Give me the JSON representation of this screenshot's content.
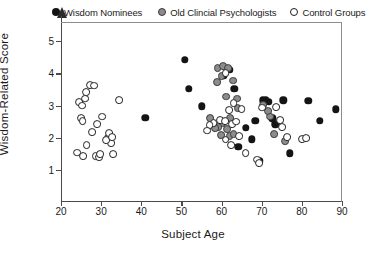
{
  "chart_data": {
    "type": "scatter",
    "title": "",
    "xlabel": "Subject Age",
    "ylabel": "Wisdom-Related Score",
    "xlim": [
      20,
      90
    ],
    "ylim": [
      0,
      5.6
    ],
    "xticks": [
      20,
      30,
      40,
      50,
      60,
      70,
      80,
      90
    ],
    "yticks": [
      1,
      2,
      3,
      4,
      5
    ],
    "grid": false,
    "legend_position": "top",
    "series": [
      {
        "name": "Wisdom Nominees",
        "marker": "filled-circle",
        "color": "#141414",
        "points": [
          [
            41.0,
            2.62
          ],
          [
            50.8,
            4.43
          ],
          [
            51.8,
            3.52
          ],
          [
            55.0,
            2.98
          ],
          [
            60.6,
            3.92
          ],
          [
            62.0,
            4.12
          ],
          [
            63.2,
            3.52
          ],
          [
            66.0,
            2.3
          ],
          [
            67.5,
            1.95
          ],
          [
            68.4,
            2.52
          ],
          [
            70.2,
            3.16
          ],
          [
            71.0,
            3.18
          ],
          [
            71.8,
            3.12
          ],
          [
            72.6,
            2.6
          ],
          [
            73.4,
            2.42
          ],
          [
            69.6,
            1.28
          ],
          [
            75.4,
            3.16
          ],
          [
            77.0,
            1.52
          ],
          [
            81.6,
            3.14
          ],
          [
            84.4,
            2.52
          ],
          [
            88.4,
            2.88
          ],
          [
            64.2,
            1.72
          ]
        ]
      },
      {
        "name": "Old Clincial Psychologists",
        "marker": "gray-circle",
        "color": "#8c8c8c",
        "points": [
          [
            59.0,
            4.16
          ],
          [
            60.4,
            4.22
          ],
          [
            61.6,
            4.16
          ],
          [
            58.8,
            3.74
          ],
          [
            62.8,
            3.78
          ],
          [
            60.0,
            3.92
          ],
          [
            61.2,
            3.28
          ],
          [
            63.8,
            3.22
          ],
          [
            64.0,
            2.92
          ],
          [
            62.2,
            2.6
          ],
          [
            60.2,
            2.44
          ],
          [
            61.4,
            2.28
          ],
          [
            59.2,
            2.32
          ],
          [
            58.4,
            2.3
          ],
          [
            59.8,
            2.08
          ],
          [
            62.0,
            2.04
          ],
          [
            57.2,
            2.6
          ],
          [
            63.0,
            2.12
          ],
          [
            70.4,
            3.02
          ],
          [
            71.6,
            2.82
          ],
          [
            72.0,
            2.66
          ],
          [
            73.0,
            2.12
          ],
          [
            75.8,
            1.9
          ]
        ]
      },
      {
        "name": "Control Groups",
        "marker": "open-circle",
        "color": "#ffffff",
        "points": [
          [
            24.6,
            3.12
          ],
          [
            25.2,
            3.0
          ],
          [
            25.0,
            2.62
          ],
          [
            25.4,
            2.52
          ],
          [
            26.2,
            3.42
          ],
          [
            26.0,
            3.22
          ],
          [
            27.2,
            3.64
          ],
          [
            28.2,
            3.62
          ],
          [
            27.8,
            2.18
          ],
          [
            26.4,
            1.78
          ],
          [
            24.0,
            1.54
          ],
          [
            25.6,
            1.42
          ],
          [
            28.6,
            1.44
          ],
          [
            29.4,
            1.4
          ],
          [
            29.8,
            1.48
          ],
          [
            29.0,
            2.42
          ],
          [
            30.2,
            2.66
          ],
          [
            31.6,
            1.98
          ],
          [
            32.0,
            2.14
          ],
          [
            32.4,
            1.84
          ],
          [
            33.0,
            1.5
          ],
          [
            31.2,
            1.92
          ],
          [
            32.8,
            2.02
          ],
          [
            34.4,
            3.18
          ],
          [
            61.0,
            4.02
          ],
          [
            63.0,
            3.08
          ],
          [
            61.8,
            2.86
          ],
          [
            59.6,
            2.56
          ],
          [
            60.8,
            2.52
          ],
          [
            58.0,
            2.46
          ],
          [
            57.0,
            2.4
          ],
          [
            56.4,
            2.22
          ],
          [
            62.6,
            2.42
          ],
          [
            63.6,
            2.5
          ],
          [
            61.0,
            1.94
          ],
          [
            62.4,
            1.76
          ],
          [
            64.4,
            2.06
          ],
          [
            66.0,
            1.52
          ],
          [
            65.0,
            2.9
          ],
          [
            68.8,
            1.32
          ],
          [
            69.4,
            1.22
          ],
          [
            70.0,
            2.94
          ],
          [
            73.6,
            2.96
          ],
          [
            74.6,
            2.56
          ],
          [
            75.0,
            2.34
          ],
          [
            76.4,
            2.02
          ],
          [
            80.0,
            1.96
          ],
          [
            81.0,
            1.98
          ]
        ]
      }
    ]
  },
  "legend": {
    "entries": [
      {
        "label": "Wisdom Nominees",
        "marker": "filled-circle"
      },
      {
        "label": "Old Clincial Psychologists",
        "marker": "gray-circle"
      },
      {
        "label": "Control Groups",
        "marker": "open-circle"
      }
    ]
  },
  "axes": {
    "x_title": "Subject Age",
    "y_title": "Wisdom-Related Score",
    "x_tick_labels": [
      "20",
      "30",
      "40",
      "50",
      "60",
      "70",
      "80",
      "90"
    ],
    "y_tick_labels": [
      "1",
      "2",
      "3",
      "4",
      "5"
    ]
  },
  "colors": {
    "wisdom": "#141414",
    "old_psych": "#8c8c8c",
    "control": "#ffffff",
    "axis": "#4a4a4a"
  }
}
